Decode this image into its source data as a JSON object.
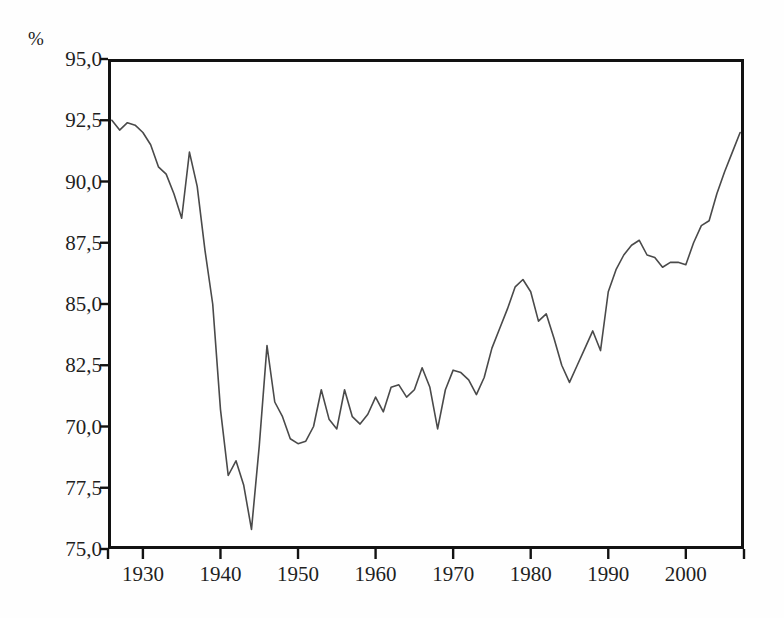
{
  "chart_data": {
    "type": "line",
    "title": "",
    "subtitle": "",
    "xlabel": "",
    "ylabel": "%",
    "unit_label": "%",
    "grid": false,
    "legend": null,
    "legend_position": "none",
    "line_color": "#4a4a4a",
    "frame_color": "#121212",
    "background_color": "#ffffff",
    "xlim": [
      1925.5,
      2007.5
    ],
    "ylim_positions": [
      75.0,
      95.0
    ],
    "xtick_labels": [
      "1930",
      "1940",
      "1950",
      "1960",
      "1970",
      "1980",
      "1990",
      "2000"
    ],
    "xticks": [
      1930,
      1940,
      1950,
      1960,
      1970,
      1980,
      1990,
      2000
    ],
    "ytick_labels": [
      "95,0",
      "92,5",
      "90,0",
      "87,5",
      "85,0",
      "82,5",
      "70,0",
      "77,5",
      "75,0"
    ],
    "ytick_positions": [
      95.0,
      92.5,
      90.0,
      87.5,
      85.0,
      82.5,
      80.0,
      77.5,
      75.0
    ],
    "ytick_note": "The seventh label is printed as '70,0' in the source figure where 80,0 would fall on the linear scale.",
    "x": [
      1926,
      1927,
      1928,
      1929,
      1930,
      1931,
      1932,
      1933,
      1934,
      1935,
      1936,
      1937,
      1938,
      1939,
      1940,
      1941,
      1942,
      1943,
      1944,
      1945,
      1946,
      1947,
      1948,
      1949,
      1950,
      1951,
      1952,
      1953,
      1954,
      1955,
      1956,
      1957,
      1958,
      1959,
      1960,
      1961,
      1962,
      1963,
      1964,
      1965,
      1966,
      1967,
      1968,
      1969,
      1970,
      1971,
      1972,
      1973,
      1974,
      1975,
      1976,
      1977,
      1978,
      1979,
      1980,
      1981,
      1982,
      1983,
      1984,
      1985,
      1986,
      1987,
      1988,
      1989,
      1990,
      1991,
      1992,
      1993,
      1994,
      1995,
      1996,
      1997,
      1998,
      1999,
      2000,
      2001,
      2002,
      2003,
      2004,
      2005,
      2006,
      2007
    ],
    "y": [
      92.5,
      92.1,
      92.4,
      92.3,
      92.0,
      91.5,
      90.6,
      90.3,
      89.5,
      88.5,
      91.2,
      89.8,
      87.2,
      85.0,
      80.7,
      78.0,
      78.6,
      77.6,
      75.8,
      79.2,
      83.3,
      81.0,
      80.4,
      79.5,
      79.3,
      79.4,
      80.0,
      81.5,
      80.3,
      79.9,
      81.5,
      80.4,
      80.1,
      80.5,
      81.2,
      80.6,
      81.6,
      81.7,
      81.2,
      81.5,
      82.4,
      81.6,
      79.9,
      81.5,
      82.3,
      82.2,
      81.9,
      81.3,
      82.0,
      83.2,
      84.0,
      84.8,
      85.7,
      86.0,
      85.5,
      84.3,
      84.6,
      83.6,
      82.5,
      81.8,
      82.5,
      83.2,
      83.9,
      83.1,
      85.5,
      86.4,
      87.0,
      87.4,
      87.6,
      87.0,
      86.9,
      86.5,
      86.7,
      86.7,
      86.6,
      87.5,
      88.2,
      88.4,
      89.5,
      90.4,
      91.2,
      92.0
    ],
    "series_name": "share"
  },
  "axes": {
    "unit_label": "%",
    "y_axis_name": "percent-axis",
    "x_axis_name": "year-axis"
  }
}
